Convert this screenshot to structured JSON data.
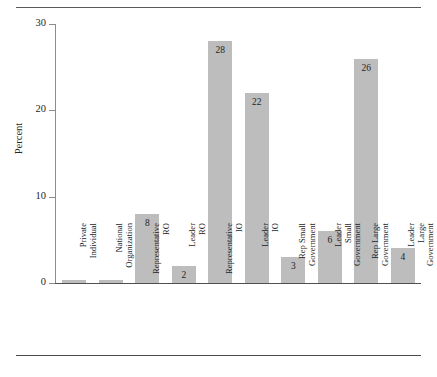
{
  "chart_data": {
    "type": "bar",
    "title": "",
    "subtitle": "",
    "xlabel": "",
    "ylabel": "Percent",
    "ylim": [
      0,
      30
    ],
    "yticks": [
      0,
      10,
      20,
      30
    ],
    "ytick_labels": [
      "0",
      "10",
      "20",
      "30"
    ],
    "grid": false,
    "legend": null,
    "bar_color": "#bdbdbd",
    "categories": [
      "Private Individual",
      "National Organization",
      "Representative RO",
      "Leader RO",
      "Representative IO",
      "Leader IO",
      "Rep Small Government",
      "Leader Small Government",
      "Rep Large Government",
      "Leader Large Government"
    ],
    "category_lines": [
      [
        "Private",
        "Individual"
      ],
      [
        "National",
        "Organization"
      ],
      [
        "Representative",
        "RO"
      ],
      [
        "Leader",
        "RO"
      ],
      [
        "Representative",
        "IO"
      ],
      [
        "Leader",
        "IO"
      ],
      [
        "Rep Small",
        "Government"
      ],
      [
        "Leader",
        "Small",
        "Government"
      ],
      [
        "Rep Large",
        "Government"
      ],
      [
        "Leader",
        "Large",
        "Government"
      ]
    ],
    "values": [
      0.3,
      0.3,
      8,
      2,
      28,
      22,
      3,
      6,
      26,
      4
    ],
    "value_labels": [
      "",
      "",
      "8",
      "2",
      "28",
      "22",
      "3",
      "6",
      "26",
      "4"
    ]
  },
  "figure": {
    "top_rule": true,
    "bottom_rule": true
  }
}
